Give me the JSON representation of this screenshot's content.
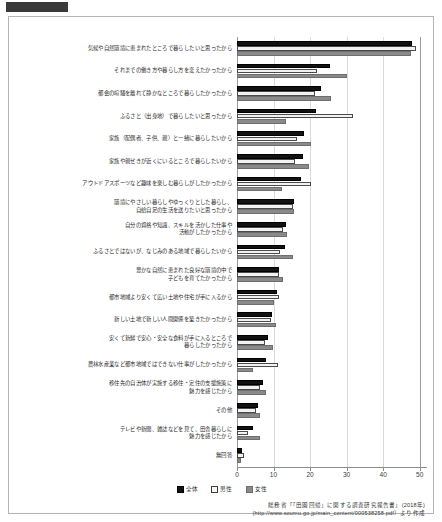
{
  "chart_data": {
    "type": "bar",
    "orientation": "horizontal",
    "title": "",
    "xlabel": "",
    "ylabel": "",
    "xlim": [
      0,
      52
    ],
    "grid": true,
    "legend_position": "bottom-center",
    "ticks": [
      0,
      10,
      20,
      30,
      40,
      50
    ],
    "tick_labels": [
      "0",
      "10",
      "20",
      "30",
      "40",
      "50"
    ],
    "series": [
      {
        "name": "全体",
        "color": "#121212",
        "values": [
          48.0,
          25.4,
          22.9,
          21.5,
          18.4,
          18.0,
          17.6,
          15.6,
          13.3,
          13.0,
          11.6,
          11.0,
          9.7,
          8.4,
          7.9,
          7.1,
          5.7,
          4.5,
          1.5
        ]
      },
      {
        "name": "男性",
        "color": "#f2f2f2",
        "values": [
          49.0,
          21.8,
          21.4,
          31.8,
          16.4,
          15.8,
          20.2,
          15.4,
          12.6,
          11.9,
          11.4,
          11.6,
          9.4,
          7.7,
          11.3,
          6.2,
          5.1,
          3.1,
          2.0
        ]
      },
      {
        "name": "女性",
        "color": "#8a8a8a",
        "values": [
          47.5,
          30.0,
          25.6,
          13.3,
          20.2,
          19.7,
          12.4,
          15.5,
          13.6,
          15.3,
          12.5,
          10.2,
          10.6,
          9.8,
          4.3,
          7.8,
          6.2,
          6.4,
          1.0
        ]
      }
    ],
    "categories": [
      "気候や自然環境に恵まれたところで暮らしたいと思ったから",
      "それまでの働き方や暮らし方を変えたかったから",
      "都会の喧騒を離れて静かなところで暮らしたかったから",
      "ふるさと（出身地）で暮らしたいと思ったから",
      "家族（配偶者、子供、親）と一緒に暮らしたいから",
      "家族や親せきが近くにいるところで暮らしたいから",
      "アウトドアスポーツなど趣味を楽しむ暮らしがしたかったから",
      "環境にやさしい暮らしやゆっくりとした暮らし、\n自給自足の生活を送りたいと思ったから",
      "自分の資格や知識、スキルを活かした仕事や\n活動がしたかったから",
      "ふるさとではないが、なじみのある地域で暮らしたいから",
      "豊かな自然に恵まれた良好な環境の中で\n子どもを育てたかったから",
      "都市地域より安くて広い土地や住宅が手に入るから",
      "新しい土地で新しい人間関係を築きたかったから",
      "安くて新鮮で安心・安全な食料が手に入るところで\n暮らしたかったから",
      "農林水産業など都市地域ではできない仕事がしたかったから",
      "移住先の自治体が実施する移住・定住の支援施策に\n魅力を感じたから",
      "その他",
      "テレビや新聞、雑誌などを見て、田舎暮らしに\n魅力を感じたから",
      "無回答"
    ]
  },
  "legend": {
    "items": [
      {
        "label": "全体",
        "key": "total"
      },
      {
        "label": "男性",
        "key": "male"
      },
      {
        "label": "女性",
        "key": "female"
      }
    ]
  },
  "source": {
    "line1": "総務省「「田園回帰」に関する調査研究報告書」(2018年)",
    "line2": "(http://www.soumu.go.jp/main_content/000538258.pdf）より作成"
  }
}
